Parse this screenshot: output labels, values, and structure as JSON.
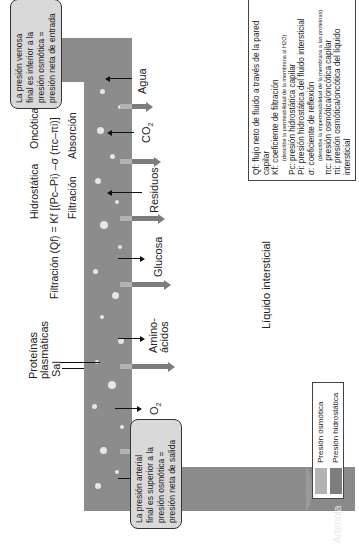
{
  "vessels": {
    "arteriole_label": "Arteriola",
    "venule_label": "Vénula"
  },
  "notes": {
    "arterial": [
      "La presión arterial",
      "final es superior a la",
      "presión osmótica =",
      "presión neta de salida"
    ],
    "venous": [
      "La presión venosa",
      "final es inferior a la",
      "presión osmótica =",
      "presión neta de entrada"
    ]
  },
  "equation": {
    "top_left": "Hidrostática",
    "top_right": "Oncótica",
    "formula": "Filtración (Qf) = Kf [(Pc–Pi) –σ (πc–πi)]",
    "bottom_left": "Filtración",
    "bottom_right": "Absorción"
  },
  "substances": [
    {
      "label": "Agua",
      "direction": "out"
    },
    {
      "label": "Sal",
      "direction": "out"
    },
    {
      "label": "O2",
      "direction": "out"
    },
    {
      "label": "Proteínas plasmáticas",
      "direction": "in-capillary"
    },
    {
      "label": "Amino-ácidos",
      "direction": "out"
    },
    {
      "label": "Glucosa",
      "direction": "out"
    },
    {
      "label": "Residuos",
      "direction": "in"
    },
    {
      "label": "CO2",
      "direction": "in"
    },
    {
      "label": "Agua",
      "direction": "in"
    }
  ],
  "labels": {
    "agua_left": "Agua",
    "sal": "Sal",
    "o2": "O",
    "o2_sub": "2",
    "proteinas_1": "Proteínas",
    "proteinas_2": "plasmáticas",
    "amino_1": "Amino-",
    "amino_2": "ácidos",
    "glucosa": "Glucosa",
    "residuos": "Residuos",
    "co2": "CO",
    "co2_sub": "2",
    "agua_right": "Agua",
    "interstitial": "Líquido intersticial"
  },
  "legend": {
    "items": [
      {
        "label": "Presión osmótica",
        "color": "#b3b3b3"
      },
      {
        "label": "Presión hidrostática",
        "color": "#7d7d7d"
      }
    ]
  },
  "definitions": [
    {
      "sym": "Qf",
      "text": ": flujo neto de fluido a través de la pared capilar"
    },
    {
      "sym": "Kf",
      "text": ": coeficiente de filtración"
    },
    {
      "sym": "",
      "text": "(describe la permeabilidad de la membrana al H2O)",
      "small": true
    },
    {
      "sym": "Pc",
      "text": ": presión hidrostática capilar"
    },
    {
      "sym": "Pi",
      "text": ": presión hidrostática del fluido intersticial"
    },
    {
      "sym": "σ",
      "text": ": coeficiente de reflexión"
    },
    {
      "sym": "",
      "text": "(describe la impermeabilidad de la membrana a las proteínas)",
      "small": true
    },
    {
      "sym": "πc",
      "text": ": presión osmótica/oncótica capilar"
    },
    {
      "sym": "πi",
      "text": ": presión osmótica/oncótica del líquido intersticial"
    }
  ],
  "colors": {
    "vessel": "#8c8c8c",
    "osmotic": "#b3b3b3",
    "hydrostatic": "#7d7d7d"
  }
}
